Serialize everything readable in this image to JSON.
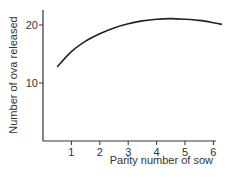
{
  "chart_data": {
    "type": "line",
    "title": "",
    "xlabel": "Parity number of sow",
    "ylabel": "Number of ova released",
    "xlim": [
      0,
      6.3
    ],
    "ylim": [
      0,
      23
    ],
    "x_ticks": [
      "1",
      "2",
      "3",
      "4",
      "5",
      "6"
    ],
    "y_ticks": [
      "10",
      "20"
    ],
    "grid": false,
    "legend": null,
    "series": [
      {
        "name": "Ova released",
        "x": [
          0.5,
          1,
          1.5,
          2,
          2.5,
          3,
          3.5,
          4,
          4.5,
          5,
          5.5,
          6,
          6.3
        ],
        "values": [
          12.8,
          15.4,
          17.2,
          18.5,
          19.5,
          20.2,
          20.7,
          21.0,
          21.1,
          21.0,
          20.8,
          20.4,
          20.1
        ]
      }
    ]
  }
}
